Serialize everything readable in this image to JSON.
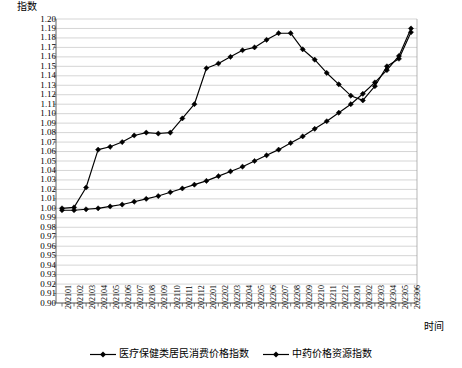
{
  "chart_data": {
    "type": "line",
    "title": "",
    "xlabel": "时间",
    "ylabel": "指数",
    "ylim": [
      0.9,
      1.2
    ],
    "ytick_step": 0.01,
    "grid": true,
    "legend_position": "bottom",
    "categories": [
      "202101",
      "202102",
      "202103",
      "202104",
      "202105",
      "202106",
      "202107",
      "202108",
      "202109",
      "202110",
      "202111",
      "202112",
      "202201",
      "202202",
      "202203",
      "202204",
      "202205",
      "202206",
      "202207",
      "202208",
      "202209",
      "202210",
      "202211",
      "202212",
      "202301",
      "202302",
      "202303",
      "202304",
      "202305",
      "202306"
    ],
    "ytick_labels": [
      "1.20",
      "1.19",
      "1.18",
      "1.17",
      "1.16",
      "1.15",
      "1.14",
      "1.13",
      "1.12",
      "1.11",
      "1.10",
      "1.09",
      "1.08",
      "1.07",
      "1.06",
      "1.05",
      "1.04",
      "1.03",
      "1.02",
      "1.01",
      "1.00",
      "0.99",
      "0.98",
      "0.97",
      "0.96",
      "0.95",
      "0.94",
      "0.93",
      "0.92",
      "0.91",
      "0.90"
    ],
    "series": [
      {
        "name": "医疗保健类居民消费价格指数",
        "marker": "diamond",
        "color": "#000000",
        "values": [
          0.998,
          0.998,
          0.999,
          1.0,
          1.002,
          1.004,
          1.007,
          1.01,
          1.013,
          1.017,
          1.021,
          1.025,
          1.029,
          1.034,
          1.039,
          1.044,
          1.05,
          1.056,
          1.062,
          1.069,
          1.076,
          1.084,
          1.092,
          1.101,
          1.11,
          1.121,
          1.133,
          1.146,
          1.161,
          1.19
        ]
      },
      {
        "name": "中药价格资源指数",
        "marker": "diamond",
        "color": "#000000",
        "values": [
          1.0,
          1.001,
          1.022,
          1.062,
          1.065,
          1.07,
          1.077,
          1.08,
          1.079,
          1.08,
          1.095,
          1.11,
          1.148,
          1.153,
          1.16,
          1.167,
          1.17,
          1.178,
          1.185,
          1.185,
          1.168,
          1.157,
          1.143,
          1.131,
          1.119,
          1.114,
          1.129,
          1.15,
          1.158,
          1.186
        ]
      }
    ]
  },
  "legend": {
    "items": [
      {
        "label": "医疗保健类居民消费价格指数"
      },
      {
        "label": "中药价格资源指数"
      }
    ]
  }
}
